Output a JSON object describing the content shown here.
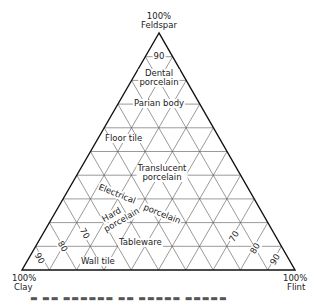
{
  "chart_data": {
    "type": "ternary",
    "title": "",
    "vertices": {
      "top": {
        "label_pct": "100%",
        "label": "Feldspar"
      },
      "bottom_left": {
        "label_pct": "100%",
        "label": "Clay"
      },
      "bottom_right": {
        "label_pct": "100%",
        "label": "Flint"
      }
    },
    "grid_step_pct": 10,
    "grid": true,
    "axis_tick_labels": {
      "feldspar": [
        "90"
      ],
      "clay": [
        "90",
        "80",
        "70"
      ],
      "flint": [
        "70",
        "80",
        "90"
      ]
    },
    "regions": [
      {
        "name": "Dental porcelain",
        "lines": [
          "Dental",
          "porcelain"
        ]
      },
      {
        "name": "Parian body",
        "lines": [
          "Parian body"
        ]
      },
      {
        "name": "Floor tile",
        "lines": [
          "Floor tile"
        ]
      },
      {
        "name": "Translucent porcelain",
        "lines": [
          "Translucent",
          "porcelain"
        ]
      },
      {
        "name": "Electrical porcelain",
        "lines": [
          "Electrical",
          "porcelain"
        ]
      },
      {
        "name": "Hard porcelain",
        "lines": [
          "Hard",
          "porcelain"
        ]
      },
      {
        "name": "Tableware",
        "lines": [
          "Tableware"
        ]
      },
      {
        "name": "Wall tile",
        "lines": [
          "Wall tile"
        ]
      }
    ]
  },
  "labels": {
    "feldspar_pct": "100%",
    "feldspar": "Feldspar",
    "clay_pct": "100%",
    "clay": "Clay",
    "flint_pct": "100%",
    "flint": "Flint",
    "tick_top_90": "90",
    "tick_clay_90": "90",
    "tick_clay_80": "80",
    "tick_clay_70": "70",
    "tick_flint_70": "70",
    "tick_flint_80": "80",
    "tick_flint_90": "90",
    "dental_1": "Dental",
    "dental_2": "porcelain",
    "parian": "Parian body",
    "floor": "Floor tile",
    "translucent_1": "Translucent",
    "translucent_2": "porcelain",
    "electrical_1": "Electrical",
    "electrical_2": "porcelain",
    "hard_1": "Hard",
    "hard_2": "porcelain",
    "tableware": "Tableware",
    "walltile": "Wall tile"
  }
}
